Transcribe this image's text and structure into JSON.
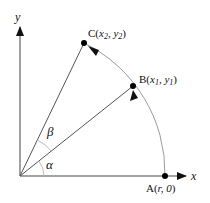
{
  "diagram": {
    "type": "rotation-geometry",
    "axes": {
      "x_label": "x",
      "y_label": "y"
    },
    "origin": {
      "px": [
        20,
        176
      ]
    },
    "radius_px": 145,
    "points": [
      {
        "id": "A",
        "label_prefix": "A(",
        "label_args": "r, 0",
        "label_suffix": ")",
        "px": [
          165,
          176
        ]
      },
      {
        "id": "B",
        "label_prefix": "B(",
        "label_args": "x1, y1",
        "label_suffix": ")",
        "px": [
          133,
          86
        ]
      },
      {
        "id": "C",
        "label_prefix": "C(",
        "label_args": "x2, y2",
        "label_suffix": ")",
        "px": [
          84,
          43
        ]
      }
    ],
    "angles": [
      {
        "symbol": "α",
        "between": [
          "OA",
          "OB"
        ]
      },
      {
        "symbol": "β",
        "between": [
          "OB",
          "OC"
        ]
      }
    ],
    "labels": {
      "A": "A(r, 0)",
      "B": "B(x1, y1)",
      "C": "C(x2, y2)",
      "alpha": "α",
      "beta": "β"
    },
    "colors": {
      "axis": "#333333",
      "arc": "#999999",
      "ray": "#555555",
      "point": "#000000",
      "text": "#111111"
    }
  }
}
